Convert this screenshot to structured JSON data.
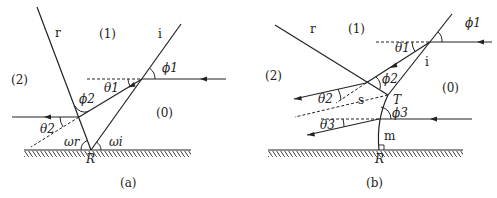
{
  "figure": {
    "panels": [
      {
        "id": "a",
        "caption": "(a)",
        "regions": {
          "r1": "(1)",
          "r2": "(2)",
          "r0": "(0)"
        },
        "line_labels": {
          "reflected": "r",
          "incident": "i"
        },
        "point_labels": {
          "reflection_point": "R"
        },
        "angle_labels": {
          "phi1": "ϕ1",
          "theta1": "θ1",
          "phi2": "ϕ2",
          "theta2": "θ2",
          "omega_r": "ωr",
          "omega_i": "ωi"
        }
      },
      {
        "id": "b",
        "caption": "(b)",
        "regions": {
          "r1": "(1)",
          "r2": "(2)",
          "r0": "(0)"
        },
        "line_labels": {
          "reflected": "r",
          "incident": "i",
          "s": "s",
          "m": "m"
        },
        "point_labels": {
          "triple_point": "T",
          "reflection_point": "R"
        },
        "angle_labels": {
          "phi1": "ϕ1",
          "theta1": "θ1",
          "phi2": "ϕ2",
          "theta2": "θ2",
          "phi3": "ϕ3",
          "theta3": "θ3"
        }
      }
    ]
  },
  "colors": {
    "line": "#222222",
    "background": "#ffffff"
  }
}
